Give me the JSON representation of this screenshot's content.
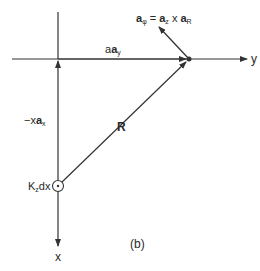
{
  "figure": {
    "caption": "(b)",
    "axes": {
      "y_label": "y",
      "x_label": "x"
    },
    "vectors": {
      "aphi": {
        "main": "a",
        "sub": "φ",
        "eq": " = ",
        "r1": "a",
        "r1sub": "z",
        "cross": " x ",
        "r2": "a",
        "r2sub": "R"
      },
      "aay": {
        "coef": "a",
        "vec": "a",
        "sub": "y"
      },
      "xax": {
        "coef": "−x",
        "vec": "a",
        "sub": "x"
      },
      "R": {
        "label": "R"
      }
    },
    "source": {
      "main": "K",
      "sub": "z",
      "rest": "dx"
    },
    "colors": {
      "line": "#333333",
      "text": "#2a2a2a",
      "background": "#ffffff"
    }
  }
}
